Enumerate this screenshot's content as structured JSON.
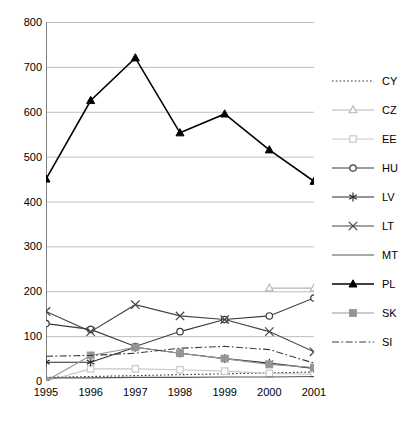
{
  "chart_data": {
    "type": "line",
    "title": "",
    "xlabel": "",
    "ylabel": "",
    "categories": [
      "1995",
      "1996",
      "1997",
      "1998",
      "1999",
      "2000",
      "2001"
    ],
    "x": [
      1995,
      1996,
      1997,
      1998,
      1999,
      2000,
      2001
    ],
    "ylim": [
      0,
      800
    ],
    "ytick_step": 100,
    "yticks": [
      "0",
      "100",
      "200",
      "300",
      "400",
      "500",
      "600",
      "700",
      "800"
    ],
    "grid": "horizontal",
    "legend_position": "right",
    "series": [
      {
        "name": "CY",
        "label": "CY",
        "marker": "none",
        "line_style": "dotted",
        "color": "#333333",
        "values": [
          8,
          10,
          12,
          14,
          16,
          18,
          20
        ]
      },
      {
        "name": "CZ",
        "label": "CZ",
        "marker": "triangle-open",
        "line_style": "solid",
        "color": "#b5b5b5",
        "values": [
          null,
          null,
          null,
          null,
          null,
          207,
          207
        ]
      },
      {
        "name": "EE",
        "label": "EE",
        "marker": "square-open",
        "line_style": "solid",
        "color": "#c8c8c8",
        "values": [
          0,
          27,
          27,
          25,
          22,
          17,
          15
        ]
      },
      {
        "name": "HU",
        "label": "HU",
        "marker": "circle-open",
        "line_style": "solid",
        "color": "#3a3a3a",
        "values": [
          128,
          115,
          77,
          110,
          137,
          145,
          185
        ]
      },
      {
        "name": "LV",
        "label": "LV",
        "marker": "asterisk",
        "line_style": "solid",
        "color": "#2b2b2b",
        "values": [
          42,
          42,
          75,
          62,
          50,
          40,
          28
        ]
      },
      {
        "name": "LT",
        "label": "LT",
        "marker": "cross",
        "line_style": "solid",
        "color": "#444444",
        "values": [
          155,
          110,
          170,
          145,
          137,
          110,
          65
        ]
      },
      {
        "name": "MT",
        "label": "MT",
        "marker": "none",
        "line_style": "solid",
        "color": "#555555",
        "values": [
          7,
          7,
          8,
          8,
          9,
          9,
          10
        ]
      },
      {
        "name": "PL",
        "label": "PL",
        "marker": "triangle-filled",
        "line_style": "solid",
        "color": "#000000",
        "values": [
          450,
          625,
          720,
          553,
          595,
          515,
          445
        ]
      },
      {
        "name": "SK",
        "label": "SK",
        "marker": "square-filled",
        "line_style": "solid",
        "color": "#969696",
        "values": [
          0,
          57,
          75,
          62,
          50,
          37,
          30
        ]
      },
      {
        "name": "SI",
        "label": "SI",
        "marker": "none",
        "line_style": "dashdot",
        "color": "#3d3d3d",
        "values": [
          55,
          57,
          62,
          73,
          77,
          70,
          40
        ]
      }
    ]
  }
}
